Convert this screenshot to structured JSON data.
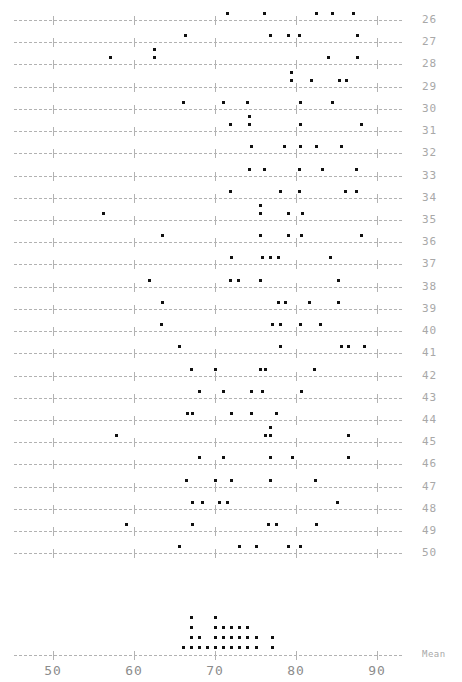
{
  "chart_data": {
    "type": "scatter",
    "title": "",
    "xlabel": "",
    "ylabel": "",
    "xlim": [
      45,
      95
    ],
    "xticks": [
      50,
      60,
      70,
      80,
      90
    ],
    "xtick_labels": [
      "50",
      "60",
      "70",
      "80",
      "90"
    ],
    "grid": true,
    "legend": null,
    "row_labels": [
      "26",
      "27",
      "28",
      "29",
      "30",
      "31",
      "32",
      "33",
      "34",
      "35",
      "36",
      "37",
      "38",
      "39",
      "40",
      "41",
      "42",
      "43",
      "44",
      "45",
      "46",
      "47",
      "48",
      "49",
      "50"
    ],
    "mean_row_label": "Mean",
    "rows": [
      {
        "label": "26",
        "values": [
          71.5,
          76.0,
          82.5,
          84.5,
          87.0
        ]
      },
      {
        "label": "27",
        "values": [
          66.3,
          76.8,
          79.0,
          80.4,
          87.5
        ]
      },
      {
        "label": "28",
        "values": [
          57.0,
          62.5,
          62.5,
          84.0,
          87.5
        ]
      },
      {
        "label": "29",
        "values": [
          79.4,
          79.4,
          81.9,
          85.3,
          86.2
        ]
      },
      {
        "label": "30",
        "values": [
          66.0,
          71.0,
          74.0,
          80.5,
          84.5
        ]
      },
      {
        "label": "31",
        "values": [
          71.8,
          74.2,
          74.2,
          80.5,
          88.0
        ]
      },
      {
        "label": "32",
        "values": [
          74.5,
          78.5,
          80.5,
          82.5,
          85.5
        ]
      },
      {
        "label": "33",
        "values": [
          74.2,
          76.0,
          80.4,
          83.2,
          87.4
        ]
      },
      {
        "label": "34",
        "values": [
          71.8,
          78.0,
          80.4,
          86.0,
          87.4
        ]
      },
      {
        "label": "35",
        "values": [
          56.2,
          75.5,
          75.5,
          79.0,
          80.7
        ]
      },
      {
        "label": "36",
        "values": [
          63.5,
          75.5,
          79.0,
          80.6,
          88.0
        ]
      },
      {
        "label": "37",
        "values": [
          72.0,
          75.8,
          76.8,
          77.8,
          84.2
        ]
      },
      {
        "label": "38",
        "values": [
          61.8,
          71.8,
          72.8,
          75.5,
          85.2
        ]
      },
      {
        "label": "39",
        "values": [
          63.5,
          77.8,
          78.6,
          81.6,
          85.2
        ]
      },
      {
        "label": "40",
        "values": [
          63.3,
          77.0,
          78.0,
          80.5,
          83.0
        ]
      },
      {
        "label": "41",
        "values": [
          65.5,
          78.0,
          85.5,
          86.4,
          88.4
        ]
      },
      {
        "label": "42",
        "values": [
          67.0,
          70.0,
          75.6,
          76.2,
          82.2
        ]
      },
      {
        "label": "43",
        "values": [
          68.0,
          71.0,
          74.5,
          75.8,
          80.6
        ]
      },
      {
        "label": "44",
        "values": [
          66.6,
          67.2,
          72.0,
          74.5,
          77.5
        ]
      },
      {
        "label": "45",
        "values": [
          57.8,
          76.2,
          76.8,
          76.8,
          86.4
        ]
      },
      {
        "label": "46",
        "values": [
          68.0,
          71.0,
          76.8,
          79.5,
          86.4
        ]
      },
      {
        "label": "47",
        "values": [
          66.4,
          70.0,
          72.0,
          76.8,
          82.4
        ]
      },
      {
        "label": "48",
        "values": [
          67.2,
          68.4,
          70.5,
          71.5,
          85.0
        ]
      },
      {
        "label": "49",
        "values": [
          59.0,
          67.2,
          76.5,
          77.5,
          82.5
        ]
      },
      {
        "label": "50",
        "values": [
          65.5,
          73.0,
          75.0,
          79.0,
          80.5
        ]
      }
    ],
    "mean_dotplot": {
      "label": "Mean",
      "dot_value_step": 1.0,
      "columns": [
        {
          "value": 66.0,
          "count": 1
        },
        {
          "value": 67.0,
          "count": 4
        },
        {
          "value": 68.0,
          "count": 2
        },
        {
          "value": 69.0,
          "count": 1
        },
        {
          "value": 70.0,
          "count": 4
        },
        {
          "value": 71.0,
          "count": 3
        },
        {
          "value": 72.0,
          "count": 3
        },
        {
          "value": 73.0,
          "count": 3
        },
        {
          "value": 74.0,
          "count": 3
        },
        {
          "value": 75.0,
          "count": 2
        },
        {
          "value": 77.0,
          "count": 2
        }
      ]
    }
  }
}
